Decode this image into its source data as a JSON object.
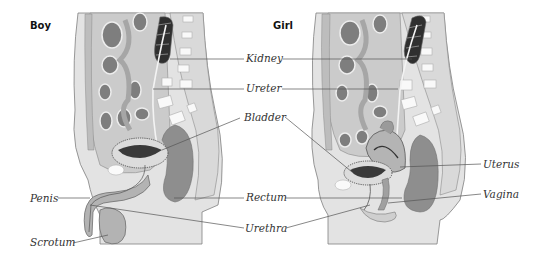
{
  "figures": [
    {
      "id": "boy",
      "title": "Boy"
    },
    {
      "id": "girl",
      "title": "Girl"
    }
  ],
  "labels": {
    "shared": [
      "Kidney",
      "Ureter",
      "Bladder",
      "Rectum",
      "Urethra"
    ],
    "boy_only": [
      "Penis",
      "Scrotum"
    ],
    "girl_only": [
      "Uterus",
      "Vagina"
    ]
  },
  "text": {
    "boy": "Boy",
    "girl": "Girl",
    "kidney": "Kidney",
    "ureter": "Ureter",
    "bladder": "Bladder",
    "rectum": "Rectum",
    "urethra": "Urethra",
    "penis": "Penis",
    "scrotum": "Scrotum",
    "uterus": "Uterus",
    "vagina": "Vagina"
  },
  "colors": {
    "outline": "#777777",
    "body_light": "#e6e6e6",
    "body_mid": "#cfcfcf",
    "organ_mid": "#a9a9a9",
    "organ_dark": "#7a7a7a",
    "kidney_dark": "#2e2e2e",
    "vertebra": "#f7f7f7",
    "leader": "#555555"
  }
}
